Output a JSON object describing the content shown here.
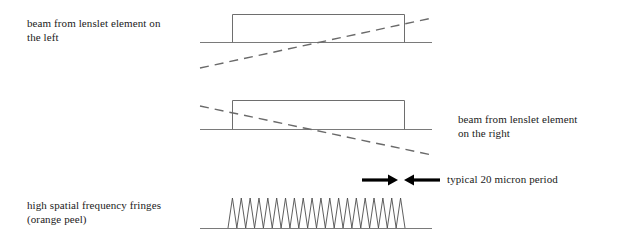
{
  "figure": {
    "background_color": "#ffffff",
    "width": 618,
    "height": 243
  },
  "captions": {
    "left_beam": "beam from lenslet element on\nthe left",
    "right_beam": "beam from lenslet element\non the right",
    "fringes": "high spatial frequency fringes\n(orange peel)",
    "period": "typical 20 micron period"
  },
  "colors": {
    "line": "#7a7a7a",
    "dashed_line": "#6a6a6a",
    "fringe": "#4d4d4d",
    "arrow": "#000000",
    "text": "#1a1a1a"
  },
  "chart_data": {
    "type": "line",
    "xlabel": "",
    "ylabel": "",
    "panels": [
      {
        "name": "beam-left-panel",
        "label": "beam from lenslet element on the left",
        "baseline": {
          "x_start": 200,
          "x_end": 432,
          "y": 42
        },
        "pulse": {
          "x_left": 232,
          "x_right": 404,
          "y_top": 14,
          "y_base": 42,
          "shape": "top-hat rectangle"
        },
        "tilt_line": {
          "x_start": 200,
          "y_start": 68,
          "x_end": 432,
          "y_end": 18,
          "style": "dashed",
          "slope": "rising"
        }
      },
      {
        "name": "beam-right-panel",
        "label": "beam from lenslet element on the right",
        "baseline": {
          "x_start": 200,
          "x_end": 432,
          "y": 129
        },
        "pulse": {
          "x_left": 232,
          "x_right": 404,
          "y_top": 100,
          "y_base": 129,
          "shape": "top-hat rectangle"
        },
        "tilt_line": {
          "x_start": 200,
          "y_start": 106,
          "x_end": 432,
          "y_end": 155,
          "style": "dashed",
          "slope": "falling"
        }
      },
      {
        "name": "fringes-panel",
        "label": "high spatial frequency fringes (orange peel)",
        "baseline": {
          "x_start": 200,
          "x_end": 432,
          "y": 228
        },
        "fringes": {
          "x_start": 228,
          "x_end": 405,
          "y_base": 228,
          "y_peak": 198,
          "peak_count": 20,
          "period_px": 8.85,
          "waveform": "triangular"
        }
      }
    ],
    "annotations": [
      {
        "name": "period-measure",
        "text": "typical 20 micron period",
        "value": 20,
        "unit": "micron",
        "quantity": "period",
        "arrows": [
          {
            "direction": "right",
            "x_start": 362,
            "x_end": 398,
            "y": 180
          },
          {
            "direction": "left",
            "x_start": 440,
            "x_end": 404,
            "y": 180
          }
        ],
        "text_x": 447,
        "text_y": 180
      }
    ]
  }
}
